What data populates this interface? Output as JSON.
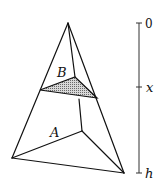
{
  "diagram": {
    "type": "pyramid-cross-section",
    "colors": {
      "stroke": "#111111",
      "shade": "#9a9a9a",
      "background": "#ffffff"
    },
    "vertices": {
      "apex": [
        68,
        23
      ],
      "base_left": [
        12,
        158
      ],
      "base_right": [
        124,
        173
      ],
      "base_back": [
        82,
        131
      ]
    },
    "cross_section": {
      "label": "B",
      "points": [
        [
          40,
          90
        ],
        [
          97,
          98
        ],
        [
          75,
          77
        ]
      ]
    },
    "base": {
      "label": "A"
    },
    "scale": {
      "ticks": [
        {
          "label": "0",
          "y": 23
        },
        {
          "label": "x",
          "y": 87
        },
        {
          "label": "h",
          "y": 173
        }
      ]
    }
  }
}
